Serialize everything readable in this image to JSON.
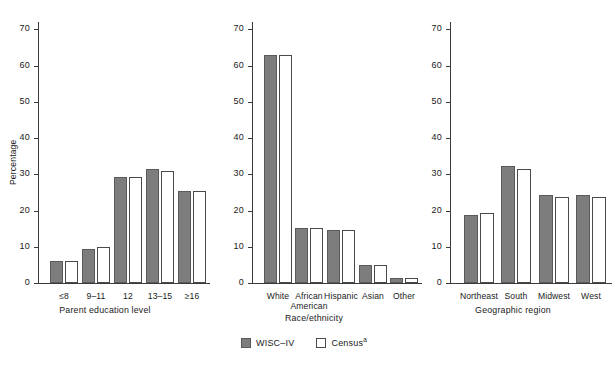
{
  "chart_data": {
    "type": "bar",
    "title": "",
    "subtitle": "",
    "ylabel": "Percentage",
    "ylim": [
      0,
      72
    ],
    "yticks": [
      0,
      10,
      20,
      30,
      40,
      50,
      60,
      70
    ],
    "grid": false,
    "legend_position": "bottom-center",
    "series_names": [
      "WISC–IV",
      "Census"
    ],
    "series_colors": {
      "wisc": "#7d7d7d",
      "census": "#ffffff",
      "outline": "#4a4a4a",
      "axis": "#3a3a3a"
    },
    "panels": [
      {
        "xlabel": "Parent education level",
        "categories": [
          "≤8",
          "9–11",
          "12",
          "13–15",
          "≥16"
        ],
        "series": [
          {
            "name": "WISC–IV",
            "values": [
              6.0,
              9.3,
              29.2,
              31.4,
              25.4
            ]
          },
          {
            "name": "Census",
            "values": [
              6.0,
              9.8,
              29.2,
              30.9,
              25.4
            ]
          }
        ]
      },
      {
        "xlabel": "Race/ethnicity",
        "categories": [
          "White",
          "African American",
          "Hispanic",
          "Asian",
          "Other"
        ],
        "category_lines": [
          [
            "White"
          ],
          [
            "African",
            "American"
          ],
          [
            "Hispanic"
          ],
          [
            "Asian"
          ],
          [
            "Other"
          ]
        ],
        "series": [
          {
            "name": "WISC–IV",
            "values": [
              62.8,
              15.1,
              14.6,
              5.1,
              1.5
            ]
          },
          {
            "name": "Census",
            "values": [
              63.0,
              15.1,
              14.6,
              5.1,
              1.5
            ]
          }
        ]
      },
      {
        "xlabel": "Geographic region",
        "categories": [
          "Northeast",
          "South",
          "Midwest",
          "West"
        ],
        "series": [
          {
            "name": "WISC–IV",
            "values": [
              18.8,
              32.2,
              24.2,
              24.2
            ]
          },
          {
            "name": "Census",
            "values": [
              19.2,
              31.5,
              23.8,
              23.8
            ]
          }
        ]
      }
    ]
  },
  "legend": {
    "items": [
      {
        "key": "wisc",
        "label": "WISC–IV",
        "sup": ""
      },
      {
        "key": "census",
        "label": "Census",
        "sup": "a"
      }
    ]
  }
}
